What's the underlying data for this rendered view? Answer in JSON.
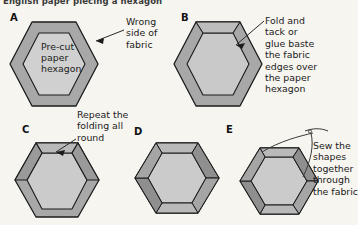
{
  "figure": {
    "title": "English paper piecing a hexagon",
    "background_color": "#f7f5f0",
    "fabric_color": "#a8a8a8",
    "paper_color": "#cfcfcf",
    "flap_color": "#b4b4b4",
    "outline_color": "#1b1b1b",
    "leader_color": "#3a3a3a"
  },
  "panels": [
    {
      "letter": "A",
      "inner_label": "Pre-cut\npaper\nhexagon",
      "inner_label_lines": [
        "Pre-cut",
        "paper",
        "hexagon"
      ],
      "callout": "Wrong\nside of\nfabric",
      "callout_lines": [
        "Wrong",
        "side of",
        "fabric"
      ]
    },
    {
      "letter": "B",
      "callout": "Fold and\ntack or\nglue baste\nthe fabric\nedges over\nthe paper\nhexagon",
      "callout_lines": [
        "Fold and",
        "tack or",
        "glue baste",
        "the fabric",
        "edges over",
        "the paper",
        "hexagon"
      ]
    },
    {
      "letter": "C",
      "callout": "Repeat the\nfolding all\nround",
      "callout_lines": [
        "Repeat the",
        "folding all",
        "round"
      ]
    },
    {
      "letter": "D",
      "callout": "",
      "callout_lines": []
    },
    {
      "letter": "E",
      "callout": "Sew the\nshapes\ntogether\nthrough\nthe fabric",
      "callout_lines": [
        "Sew the",
        "shapes",
        "together",
        "through",
        "the fabric"
      ]
    }
  ]
}
